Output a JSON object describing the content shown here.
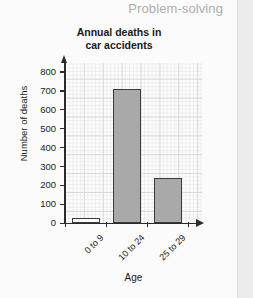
{
  "page": {
    "header_label": "Problem-solving",
    "header_color": "#adadad",
    "background_color": "#ececec",
    "card_color": "#fbfbfb"
  },
  "chart_data": {
    "type": "bar",
    "title": "Annual deaths in car accidents",
    "title_line1": "Annual deaths in",
    "title_line2": "car accidents",
    "xlabel": "Age",
    "ylabel": "Number of deaths",
    "categories": [
      "0 to 9",
      "10 to 24",
      "25 to 29"
    ],
    "values": [
      25,
      710,
      240
    ],
    "ylim": [
      0,
      800
    ],
    "ytick_step": 100,
    "yticks": [
      0,
      100,
      200,
      300,
      400,
      500,
      600,
      700,
      800
    ],
    "ytick_labels": [
      "0",
      "100",
      "200",
      "300",
      "400",
      "500",
      "600",
      "700",
      "800"
    ],
    "grid": true,
    "grid_style": "graph-paper",
    "legend": "none",
    "bar_fill_colors": [
      "#fcfcfc",
      "#a9a9a9",
      "#a9a9a9"
    ],
    "bar_edge_color": "#3a3a3a",
    "axis_color": "#2b2b2b",
    "axis_arrows": true
  }
}
